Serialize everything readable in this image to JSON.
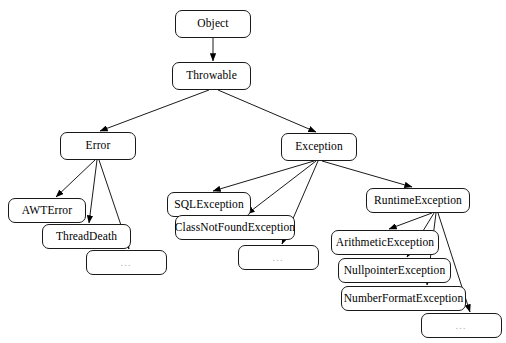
{
  "diagram": {
    "background_color": "#ffffff",
    "node_border_color": "#1a1a1a",
    "edge_color": "#000000",
    "ellipsis_text_color": "#b4b4b4",
    "nodes": [
      {
        "id": "object",
        "label": "Object",
        "x": 175,
        "y": 10,
        "w": 76,
        "h": 28,
        "kind": "class"
      },
      {
        "id": "throwable",
        "label": "Throwable",
        "x": 172,
        "y": 62,
        "w": 79,
        "h": 28,
        "kind": "class"
      },
      {
        "id": "error",
        "label": "Error",
        "x": 60,
        "y": 132,
        "w": 76,
        "h": 28,
        "kind": "class"
      },
      {
        "id": "exception",
        "label": "Exception",
        "x": 281,
        "y": 133,
        "w": 76,
        "h": 28,
        "kind": "class"
      },
      {
        "id": "awterror",
        "label": "AWTError",
        "x": 8,
        "y": 198,
        "w": 78,
        "h": 25,
        "kind": "class"
      },
      {
        "id": "threaddeath",
        "label": "ThreadDeath",
        "x": 42,
        "y": 224,
        "w": 89,
        "h": 25,
        "kind": "class"
      },
      {
        "id": "error-more",
        "label": "…",
        "x": 86,
        "y": 250,
        "w": 81,
        "h": 25,
        "kind": "ellipsis"
      },
      {
        "id": "sqlexception",
        "label": "SQLException",
        "x": 167,
        "y": 192,
        "w": 84,
        "h": 25,
        "kind": "class"
      },
      {
        "id": "classnotfoundexception",
        "label": "ClassNotFoundException",
        "x": 175,
        "y": 215,
        "w": 120,
        "h": 25,
        "kind": "class"
      },
      {
        "id": "exception-more",
        "label": "…",
        "x": 238,
        "y": 245,
        "w": 81,
        "h": 25,
        "kind": "ellipsis"
      },
      {
        "id": "runtimeexception",
        "label": "RuntimeException",
        "x": 366,
        "y": 188,
        "w": 104,
        "h": 25,
        "kind": "class"
      },
      {
        "id": "arithmeticexception",
        "label": "ArithmeticException",
        "x": 331,
        "y": 230,
        "w": 108,
        "h": 25,
        "kind": "class"
      },
      {
        "id": "nullpointerexception",
        "label": "NullpointerException",
        "x": 338,
        "y": 258,
        "w": 113,
        "h": 25,
        "kind": "class"
      },
      {
        "id": "numberformatexception",
        "label": "NumberFormatException",
        "x": 341,
        "y": 286,
        "w": 125,
        "h": 25,
        "kind": "class"
      },
      {
        "id": "runtime-more",
        "label": "…",
        "x": 421,
        "y": 313,
        "w": 81,
        "h": 25,
        "kind": "ellipsis"
      }
    ],
    "edges": [
      {
        "from": "object",
        "to": "throwable",
        "x1": 213,
        "y1": 38,
        "x2": 213,
        "y2": 61
      },
      {
        "from": "throwable",
        "to": "error",
        "x1": 209,
        "y1": 90,
        "x2": 100,
        "y2": 131
      },
      {
        "from": "throwable",
        "to": "exception",
        "x1": 218,
        "y1": 90,
        "x2": 316,
        "y2": 132
      },
      {
        "from": "error",
        "to": "awterror",
        "x1": 95,
        "y1": 160,
        "x2": 56,
        "y2": 197
      },
      {
        "from": "error",
        "to": "threaddeath",
        "x1": 97,
        "y1": 160,
        "x2": 89,
        "y2": 223
      },
      {
        "from": "error",
        "to": "error-more",
        "x1": 99,
        "y1": 160,
        "x2": 129,
        "y2": 249
      },
      {
        "from": "exception",
        "to": "sqlexception",
        "x1": 314,
        "y1": 161,
        "x2": 213,
        "y2": 191
      },
      {
        "from": "exception",
        "to": "classnotfoundexception",
        "x1": 316,
        "y1": 161,
        "x2": 247,
        "y2": 214
      },
      {
        "from": "exception",
        "to": "exception-more",
        "x1": 318,
        "y1": 161,
        "x2": 282,
        "y2": 244
      },
      {
        "from": "exception",
        "to": "runtimeexception",
        "x1": 322,
        "y1": 161,
        "x2": 412,
        "y2": 187
      },
      {
        "from": "runtimeexception",
        "to": "arithmeticexception",
        "x1": 432,
        "y1": 213,
        "x2": 389,
        "y2": 229
      },
      {
        "from": "runtimeexception",
        "to": "nullpointerexception",
        "x1": 434,
        "y1": 213,
        "x2": 407,
        "y2": 257
      },
      {
        "from": "runtimeexception",
        "to": "numberformatexception",
        "x1": 436,
        "y1": 213,
        "x2": 427,
        "y2": 285
      },
      {
        "from": "runtimeexception",
        "to": "runtime-more",
        "x1": 438,
        "y1": 213,
        "x2": 470,
        "y2": 312
      }
    ]
  }
}
